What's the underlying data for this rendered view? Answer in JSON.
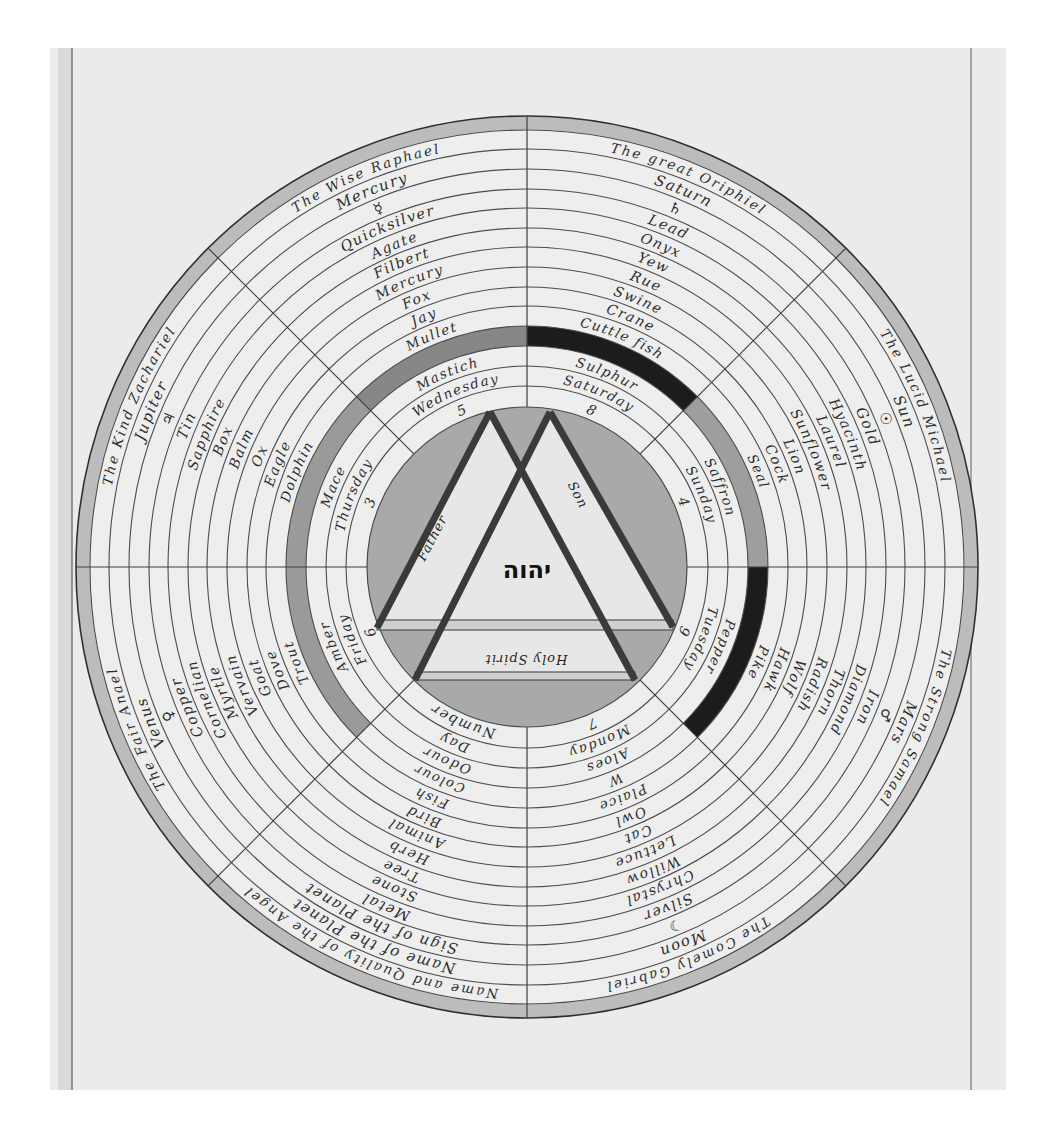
{
  "colors": {
    "page_background": "#ffffff",
    "paper": "#ebebeb",
    "paper_margin_strip": "#dadada",
    "ink": "#2d2d2d",
    "outer_border_wash": "#bcbcbc",
    "disc_wash": "#a9a9a9",
    "triangle_fill": "#e7e7e7",
    "triangle_stroke": "#3a3a3a"
  },
  "wheel": {
    "center_name": "יהוה",
    "trinity": {
      "father": "Father",
      "son": "Son",
      "holy_spirit": "Holy Spirit"
    },
    "sectors": [
      {
        "key": "saturn",
        "band_color": "#1c1c1c",
        "rings": [
          "The great Oriphiel",
          "Saturn",
          "♄",
          "Lead",
          "Onyx",
          "Yew",
          "Rue",
          "Swine",
          "Crane",
          "Cuttle fish",
          "",
          "Sulphur",
          "Saturday",
          "8"
        ]
      },
      {
        "key": "sun",
        "band_color": "#9e9e9e",
        "rings": [
          "The Lucid Michael",
          "Sun",
          "☉",
          "Gold",
          "Hyacinth",
          "Laurel",
          "Sunflower",
          "Lion",
          "Cock",
          "Seal",
          "",
          "Saffron",
          "Sunday",
          "4"
        ]
      },
      {
        "key": "mars",
        "band_color": "#1c1c1c",
        "rings": [
          "The Strong Samael",
          "Mars",
          "♂",
          "Iron",
          "Diamond",
          "Thorn",
          "Radish",
          "Wolf",
          "Hawk",
          "Pike",
          "",
          "Pepper",
          "Tuesday",
          "9"
        ]
      },
      {
        "key": "moon",
        "band_color": null,
        "rings": [
          "The Comely Gabriel",
          "Moon",
          "☽",
          "Silver",
          "Chrystal",
          "Willow",
          "Lettuce",
          "Cat",
          "Owl",
          "Plaice",
          "W",
          "Aloes",
          "Monday",
          "7"
        ]
      },
      {
        "key": "legend",
        "band_color": null,
        "rings": [
          "Name and Quality of the Angel",
          "Name of the Planet",
          "Sign of the Planet",
          "Metal",
          "Stone",
          "Tree",
          "Herb",
          "Animal",
          "Bird",
          "Fish",
          "Colour",
          "Odour",
          "Day",
          "Number"
        ]
      },
      {
        "key": "venus",
        "band_color": "#9a9a9a",
        "rings": [
          "The Fair Anael",
          "Venus",
          "♀",
          "Copper",
          "Cornelian",
          "Myrtle",
          "Vervain",
          "Goat",
          "Dove",
          "Trout",
          "",
          "Amber",
          "Friday",
          "6"
        ]
      },
      {
        "key": "jupiter",
        "band_color": "#9a9a9a",
        "rings": [
          "The Kind Zachariel",
          "Jupiter",
          "♃",
          "Tin",
          "Sapphire",
          "Box",
          "Balm",
          "Ox",
          "Eagle",
          "Dolphin",
          "",
          "Mace",
          "Thursday",
          "3"
        ]
      },
      {
        "key": "mercury",
        "band_color": "#878787",
        "rings": [
          "The Wise Raphael",
          "Mercury",
          "☿",
          "Quicksilver",
          "Agate",
          "Filbert",
          "Mercury",
          "Fox",
          "Jay",
          "Mullet",
          "",
          "Mastich",
          "Wednesday",
          "5"
        ]
      }
    ]
  }
}
